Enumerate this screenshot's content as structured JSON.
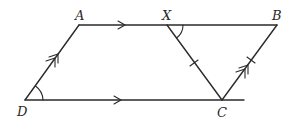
{
  "figure": {
    "points": {
      "A": {
        "label": "A"
      },
      "B": {
        "label": "B"
      },
      "C": {
        "label": "C"
      },
      "D": {
        "label": "D"
      },
      "X": {
        "label": "X"
      }
    },
    "segments": [
      {
        "from": "A",
        "to": "B",
        "marking": "single-arrow",
        "note": "parallel to DC"
      },
      {
        "from": "D",
        "to": "C",
        "marking": "single-arrow",
        "note": "parallel to AB"
      },
      {
        "from": "D",
        "to": "A",
        "marking": "double-arrow",
        "note": "parallel to CB"
      },
      {
        "from": "C",
        "to": "B",
        "marking": "double-arrow + tick",
        "note": "parallel to DA, equal to XC"
      },
      {
        "from": "X",
        "to": "C",
        "marking": "tick",
        "note": "equal to CB"
      }
    ],
    "angles": [
      {
        "vertex": "D",
        "between": [
          "A",
          "C"
        ],
        "marking": "arc"
      },
      {
        "vertex": "X",
        "between": [
          "B",
          "C"
        ],
        "marking": "arc"
      }
    ],
    "colors": {
      "ink": "#2a2a2a",
      "background": "#ffffff"
    }
  }
}
